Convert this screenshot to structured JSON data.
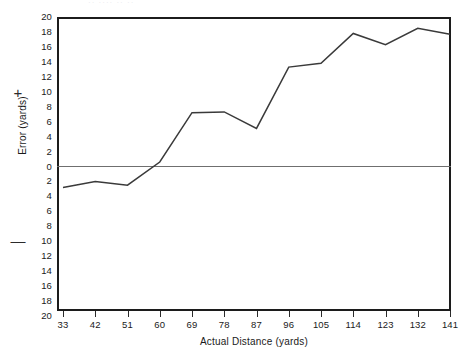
{
  "chart_data": {
    "type": "line",
    "title": "",
    "xlabel": "Actual Distance (yards)",
    "ylabel": "Error (yards)",
    "x": [
      33,
      42,
      51,
      60,
      69,
      78,
      87,
      96,
      105,
      114,
      123,
      132,
      141
    ],
    "categories": [
      "33",
      "42",
      "51",
      "60",
      "69",
      "78",
      "87",
      "96",
      "105",
      "114",
      "123",
      "132",
      "141"
    ],
    "values": [
      -2.8,
      -2.0,
      -2.5,
      0.6,
      7.2,
      7.3,
      5.1,
      13.3,
      13.8,
      17.8,
      16.3,
      18.5,
      17.7
    ],
    "series": [
      {
        "name": "Error",
        "values": [
          -2.8,
          -2.0,
          -2.5,
          0.6,
          7.2,
          7.3,
          5.1,
          13.3,
          13.8,
          17.8,
          16.3,
          18.5,
          17.7
        ]
      }
    ],
    "ylim": [
      -20,
      20
    ],
    "xlim": [
      33,
      141
    ],
    "y_tick_labels": [
      "20",
      "18",
      "16",
      "14",
      "12",
      "10",
      "8",
      "6",
      "4",
      "2",
      "0",
      "2",
      "4",
      "6",
      "8",
      "10",
      "12",
      "14",
      "16",
      "18",
      "20"
    ],
    "y_tick_values": [
      20,
      18,
      16,
      14,
      12,
      10,
      8,
      6,
      4,
      2,
      0,
      -2,
      -4,
      -6,
      -8,
      -10,
      -12,
      -14,
      -16,
      -18,
      -20
    ],
    "x_tick_labels": [
      "33",
      "42",
      "51",
      "60",
      "69",
      "78",
      "87",
      "96",
      "105",
      "114",
      "123",
      "132",
      "141"
    ],
    "sign_markers": {
      "positive": "+",
      "negative": "—"
    },
    "grid": false,
    "legend": null,
    "zero_line": true,
    "line_color": "#3a3a3a",
    "frame_color": "#1c1c1c",
    "background_color": "#ffffff"
  },
  "axes": {
    "y_title": "Error (yards)",
    "x_title": "Actual Distance (yards)"
  },
  "header_ghost": "··  ····      ··   ··"
}
